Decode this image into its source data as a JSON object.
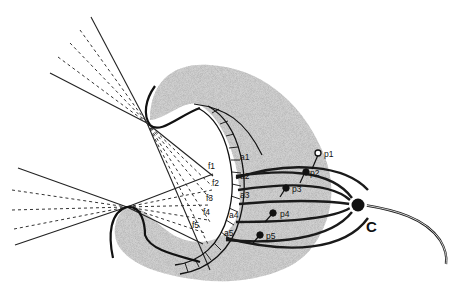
{
  "diagram": {
    "foci_labels": [
      "f1",
      "f2",
      "f3",
      "f4",
      "f5"
    ],
    "axon_labels": [
      "a1",
      "a2",
      "a3",
      "a4",
      "a5"
    ],
    "probe_labels": [
      "p1",
      "p2",
      "p3",
      "p4",
      "p5"
    ],
    "center_label": "C",
    "colors": {
      "ink": "#111111",
      "shade": "#bdbdbd",
      "background": "#ffffff"
    }
  }
}
